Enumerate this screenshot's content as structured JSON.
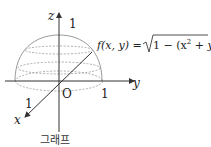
{
  "diagram": {
    "axes": {
      "x": "x",
      "y": "y",
      "z": "z",
      "origin": "O"
    },
    "ticks": {
      "z": "1",
      "y": "1",
      "x": "1"
    },
    "function_label": "f(x, y) = √1 − (x² + y²)",
    "function_parts": {
      "lhs": "f(x, y) = ",
      "radical": "1 − (x",
      "sup1": "2",
      "plus": " + y",
      "sup2": "2",
      "close": ")"
    },
    "caption": "그래프",
    "colors": {
      "surface": "#9a9a9a",
      "axes": "#333333"
    }
  }
}
